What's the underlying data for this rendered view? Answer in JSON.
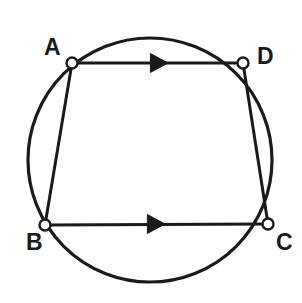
{
  "figure": {
    "background_color": "#ffffff",
    "stroke_color": "#1a1a1a",
    "label_color": "#1a1a1a",
    "vertex_fill": "#ffffff",
    "width": 302,
    "height": 303
  },
  "circle": {
    "name": "circumscribed-circle",
    "cx": 150,
    "cy": 160,
    "r": 122,
    "stroke_width": 3.2
  },
  "vertices": [
    {
      "id": "A",
      "label": "A",
      "x": 72,
      "y": 63,
      "marker_r": 5.5,
      "label_x": 44,
      "label_y": 36
    },
    {
      "id": "D",
      "label": "D",
      "x": 243,
      "y": 63,
      "marker_r": 5.5,
      "label_x": 257,
      "label_y": 45
    },
    {
      "id": "B",
      "label": "B",
      "x": 45,
      "y": 225,
      "marker_r": 5.5,
      "label_x": 26,
      "label_y": 231
    },
    {
      "id": "C",
      "label": "C",
      "x": 268,
      "y": 224,
      "marker_r": 5.5,
      "label_x": 276,
      "label_y": 231
    }
  ],
  "chords": [
    {
      "id": "AD",
      "from": "A",
      "to": "D",
      "x1": 72,
      "y1": 63,
      "x2": 243,
      "y2": 63,
      "arrow": true,
      "arrow_at": 0.5,
      "stroke_width": 3.0
    },
    {
      "id": "BC",
      "from": "B",
      "to": "C",
      "x1": 45,
      "y1": 225,
      "x2": 268,
      "y2": 224,
      "arrow": true,
      "arrow_at": 0.49,
      "stroke_width": 3.0
    },
    {
      "id": "AB",
      "from": "A",
      "to": "B",
      "x1": 72,
      "y1": 63,
      "x2": 45,
      "y2": 225,
      "arrow": false,
      "arrow_at": 0,
      "stroke_width": 3.0
    },
    {
      "id": "DC",
      "from": "D",
      "to": "C",
      "x1": 243,
      "y1": 63,
      "x2": 268,
      "y2": 224,
      "arrow": false,
      "arrow_at": 0,
      "stroke_width": 3.0
    }
  ],
  "arrow_markers": [
    {
      "id": "arrow-ad",
      "on": "AD",
      "tip_x": 168,
      "tip_y": 63,
      "size": 11,
      "direction": "right"
    },
    {
      "id": "arrow-bc",
      "on": "BC",
      "tip_x": 165,
      "tip_y": 224,
      "size": 11,
      "direction": "right"
    }
  ],
  "annotations": {
    "parallel_marks": "single arrowhead on AD and BC indicates AD is parallel to BC"
  }
}
